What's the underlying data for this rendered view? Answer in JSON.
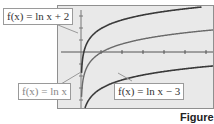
{
  "chart_data": {
    "type": "line",
    "title": "",
    "xlabel": "",
    "ylabel": "",
    "x_ticks_count": 6,
    "grid": false,
    "series": [
      {
        "name": "f(x) = ln x + 2",
        "expr": "ln(x)+2",
        "color": "#3a3a3a"
      },
      {
        "name": "f(x) = ln x",
        "expr": "ln(x)",
        "color": "#6a6a6a"
      },
      {
        "name": "f(x) = ln x - 3",
        "expr": "ln(x)-3",
        "color": "#3a3a3a"
      }
    ],
    "xlim": [
      -1,
      6
    ],
    "ylim": [
      -4,
      3
    ],
    "background": "#e9e9e9"
  },
  "labels": {
    "top_left": "f(x) = ln x + 2",
    "bottom_left": "f(x) = ln x",
    "bottom_right": "f(x) = ln x − 3"
  },
  "figure_caption": "Figure 4"
}
